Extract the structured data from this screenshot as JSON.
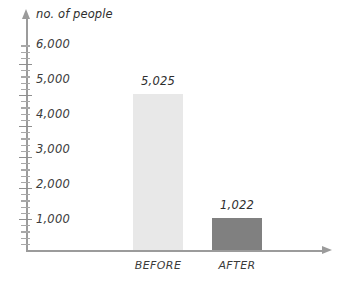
{
  "chart_data": {
    "type": "bar",
    "title": "",
    "subtitle": "",
    "xlabel": "",
    "ylabel": "no. of people",
    "categories": [
      "BEFORE",
      "AFTER"
    ],
    "values": [
      5025,
      1022
    ],
    "data_labels": [
      "5,025",
      "1,022"
    ],
    "series": [
      {
        "name": "no. of people",
        "values": [
          5025,
          1022
        ]
      }
    ],
    "ylim": [
      0,
      6600
    ],
    "y_major_step": 1000,
    "y_minor_step": 200,
    "y_tick_labels": [
      "6,000",
      "5,000",
      "4,000",
      "3,000",
      "2,000",
      "1,000"
    ],
    "y_tick_values": [
      6000,
      5000,
      4000,
      3000,
      2000,
      1000
    ],
    "grid": false,
    "legend": false,
    "legend_position": "none",
    "axis_arrows": true,
    "colors": {
      "bar_before": "#e8e8e8",
      "bar_after": "#808080",
      "axis": "#9b9b9b",
      "tick": "#a8a8a8",
      "text": "#2e2e2e",
      "background": "#ffffff"
    },
    "bars": [
      {
        "category": "BEFORE",
        "value": 5025,
        "label": "5,025",
        "color": "#e8e8e8"
      },
      {
        "category": "AFTER",
        "value": 1022,
        "label": "1,022",
        "color": "#808080"
      }
    ]
  },
  "axis": {
    "y_title": "no. of people"
  },
  "y_labels": {
    "t6000": "6,000",
    "t5000": "5,000",
    "t4000": "4,000",
    "t3000": "3,000",
    "t2000": "2,000",
    "t1000": "1,000"
  },
  "bar_values": {
    "before": "5,025",
    "after": "1,022"
  },
  "category_labels": {
    "before": "BEFORE",
    "after": "AFTER"
  }
}
